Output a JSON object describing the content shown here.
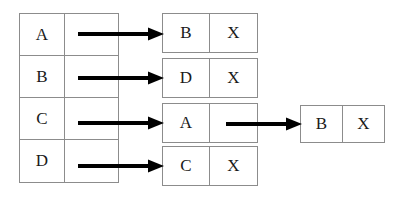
{
  "diagram": {
    "type": "hash-table-with-chaining",
    "title": "",
    "colors": {
      "border": "#8c8c8c",
      "text": "#1a1a1a",
      "arrow": "#000000",
      "background": "#ffffff"
    },
    "index_table": {
      "rows": [
        {
          "key": "A",
          "pointer": ""
        },
        {
          "key": "B",
          "pointer": ""
        },
        {
          "key": "C",
          "pointer": ""
        },
        {
          "key": "D",
          "pointer": ""
        }
      ]
    },
    "nodes": [
      {
        "key": "B",
        "next": "X"
      },
      {
        "key": "D",
        "next": "X"
      },
      {
        "key": "A",
        "next": ""
      },
      {
        "key": "C",
        "next": "X"
      }
    ],
    "tail_node": {
      "key": "B",
      "next": "X"
    },
    "arrows": [
      {
        "name": "arrow-row-a-to-node-b",
        "from": "index-row-A",
        "to": "node-0"
      },
      {
        "name": "arrow-row-b-to-node-d",
        "from": "index-row-B",
        "to": "node-1"
      },
      {
        "name": "arrow-row-c-to-node-a",
        "from": "index-row-C",
        "to": "node-2"
      },
      {
        "name": "arrow-row-d-to-node-c",
        "from": "index-row-D",
        "to": "node-3"
      },
      {
        "name": "arrow-node-a-to-tail-b",
        "from": "node-2",
        "to": "tail-node"
      }
    ]
  }
}
